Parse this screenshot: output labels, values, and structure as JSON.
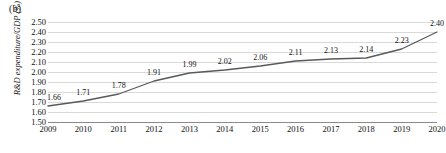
{
  "figure": {
    "panel_label": "(b)",
    "background": "#ffffff"
  },
  "chart_data": {
    "type": "line",
    "title": "",
    "subtitle": "",
    "xlabel": "",
    "ylabel": "R&D expenditure/GDP (%)",
    "categories": [
      "2009",
      "2010",
      "2011",
      "2012",
      "2013",
      "2014",
      "2015",
      "2016",
      "2017",
      "2018",
      "2019",
      "2020"
    ],
    "x": [
      2009,
      2010,
      2011,
      2012,
      2013,
      2014,
      2015,
      2016,
      2017,
      2018,
      2019,
      2020
    ],
    "values": [
      1.66,
      1.71,
      1.78,
      1.91,
      1.99,
      2.02,
      2.06,
      2.11,
      2.13,
      2.14,
      2.23,
      2.4
    ],
    "data_labels": [
      "1.66",
      "1.71",
      "1.78",
      "1.91",
      "1.99",
      "2.02",
      "2.06",
      "2.11",
      "2.13",
      "2.14",
      "2.23",
      "2.40"
    ],
    "ylim": [
      1.5,
      2.5
    ],
    "yticks": [
      1.5,
      1.6,
      1.7,
      1.8,
      1.9,
      2.0,
      2.1,
      2.2,
      2.3,
      2.4,
      2.5
    ],
    "ytick_labels": [
      "1.50",
      "1.60",
      "1.70",
      "1.80",
      "1.90",
      "2.00",
      "2.10",
      "2.20",
      "2.30",
      "2.40",
      "2.50"
    ],
    "grid": true,
    "legend": false,
    "legend_position": "none",
    "series": [
      {
        "name": "R&D expenditure/GDP (%)",
        "color": "#595959",
        "values": [
          1.66,
          1.71,
          1.78,
          1.91,
          1.99,
          2.02,
          2.06,
          2.11,
          2.13,
          2.14,
          2.23,
          2.4
        ]
      }
    ],
    "colors": {
      "line": "#595959",
      "grid": "#d9d9d9",
      "axis": "#8a8a8a",
      "text": "#111111"
    }
  }
}
